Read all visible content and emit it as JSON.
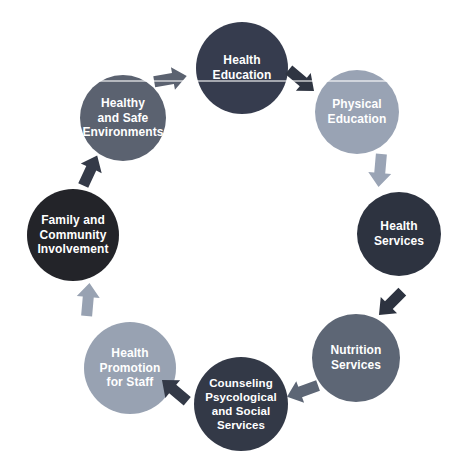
{
  "diagram": {
    "name": "coordinated-school-health-cycle",
    "background_color": "#ffffff",
    "label_text_color": "#ffffff",
    "nodes": [
      {
        "id": "health-education",
        "label": "Health\nEducation",
        "color": "#363c4e"
      },
      {
        "id": "physical-education",
        "label": "Physical\nEducation",
        "color": "#99a3b4"
      },
      {
        "id": "health-services",
        "label": "Health\nServices",
        "color": "#2d3340"
      },
      {
        "id": "nutrition-services",
        "label": "Nutrition\nServices",
        "color": "#5d6675"
      },
      {
        "id": "counseling-psycological-and-social-services",
        "label": "Counseling\nPsycological\nand Social\nServices",
        "color": "#333947"
      },
      {
        "id": "health-promotion-for-staff",
        "label": "Health\nPromotion\nfor Staff",
        "color": "#98a2b2"
      },
      {
        "id": "family-and-community-involvement",
        "label": "Family and\nCommunity\nInvolvement",
        "color": "#232429"
      },
      {
        "id": "healthy-and-safe-environments",
        "label": "Healthy\nand Safe\nEnvironments",
        "color": "#5b6270"
      }
    ],
    "arrows": [
      {
        "from": "health-education",
        "to": "physical-education",
        "color": "#2f3542"
      },
      {
        "from": "physical-education",
        "to": "health-services",
        "color": "#9aa4b5"
      },
      {
        "from": "health-services",
        "to": "nutrition-services",
        "color": "#2d3340"
      },
      {
        "from": "nutrition-services",
        "to": "counseling-psycological-and-social-services",
        "color": "#5d6675"
      },
      {
        "from": "counseling-psycological-and-social-services",
        "to": "health-promotion-for-staff",
        "color": "#333947"
      },
      {
        "from": "health-promotion-for-staff",
        "to": "family-and-community-involvement",
        "color": "#98a2b2"
      },
      {
        "from": "family-and-community-involvement",
        "to": "healthy-and-safe-environments",
        "color": "#343a48"
      },
      {
        "from": "healthy-and-safe-environments",
        "to": "health-education",
        "color": "#5b6270"
      }
    ]
  }
}
